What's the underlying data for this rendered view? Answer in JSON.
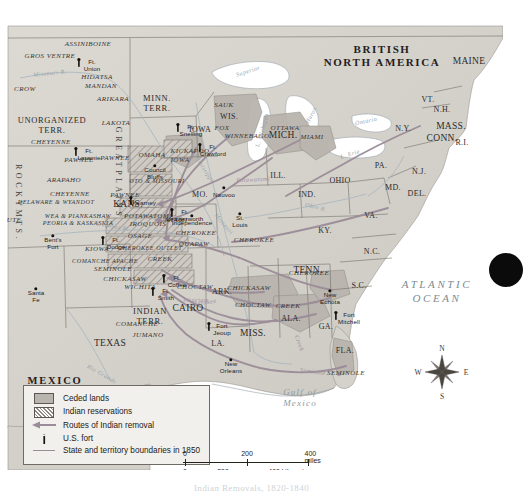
{
  "map": {
    "title": "Indian Removals, 1820-1840",
    "countries": [
      {
        "name": "BRITISH NORTH AMERICA",
        "x": 382,
        "y": 48
      },
      {
        "name": "MEXICO",
        "x": 55,
        "y": 372
      }
    ],
    "oceans": [
      {
        "name": "ATLANTIC OCEAN",
        "x": 437,
        "y": 283
      },
      {
        "name": "Gulf of Mexico",
        "x": 300,
        "y": 390
      }
    ],
    "regions": [
      {
        "name": "GREAT PLAINS",
        "x": 118,
        "y": 165
      },
      {
        "name": "ROCKY MTS.",
        "x": 18,
        "y": 195
      }
    ],
    "territories": [
      {
        "name": "UNORGANIZED TERR.",
        "x": 52,
        "y": 117
      },
      {
        "name": "MINN. TERR.",
        "x": 157,
        "y": 95
      },
      {
        "name": "INDIAN TERR.",
        "x": 150,
        "y": 308
      }
    ],
    "states": [
      {
        "name": "MAINE",
        "x": 469,
        "y": 53
      },
      {
        "name": "VT.",
        "x": 428,
        "y": 91
      },
      {
        "name": "N.H.",
        "x": 442,
        "y": 101
      },
      {
        "name": "MASS.",
        "x": 451,
        "y": 118
      },
      {
        "name": "CONN.",
        "x": 442,
        "y": 130
      },
      {
        "name": "R.I.",
        "x": 462,
        "y": 134
      },
      {
        "name": "N.Y.",
        "x": 403,
        "y": 120
      },
      {
        "name": "PA.",
        "x": 381,
        "y": 157
      },
      {
        "name": "N.J.",
        "x": 419,
        "y": 163
      },
      {
        "name": "MD.",
        "x": 393,
        "y": 179
      },
      {
        "name": "DEL.",
        "x": 417,
        "y": 185
      },
      {
        "name": "VA.",
        "x": 371,
        "y": 207
      },
      {
        "name": "OHIO",
        "x": 340,
        "y": 172
      },
      {
        "name": "IND.",
        "x": 307,
        "y": 186
      },
      {
        "name": "ILL.",
        "x": 278,
        "y": 167
      },
      {
        "name": "MICH.",
        "x": 283,
        "y": 127
      },
      {
        "name": "WIS.",
        "x": 229,
        "y": 108
      },
      {
        "name": "IOWA",
        "x": 200,
        "y": 121
      },
      {
        "name": "MO.",
        "x": 200,
        "y": 186
      },
      {
        "name": "ARK.",
        "x": 222,
        "y": 283
      },
      {
        "name": "LA.",
        "x": 218,
        "y": 335
      },
      {
        "name": "MISS.",
        "x": 253,
        "y": 325
      },
      {
        "name": "ALA.",
        "x": 291,
        "y": 310
      },
      {
        "name": "GA.",
        "x": 326,
        "y": 318
      },
      {
        "name": "FLA.",
        "x": 345,
        "y": 342
      },
      {
        "name": "TENN.",
        "x": 308,
        "y": 262
      },
      {
        "name": "KY.",
        "x": 325,
        "y": 222
      },
      {
        "name": "N.C.",
        "x": 372,
        "y": 243
      },
      {
        "name": "S.C.",
        "x": 359,
        "y": 277
      },
      {
        "name": "TEXAS",
        "x": 110,
        "y": 335
      },
      {
        "name": "KANS.",
        "x": 128,
        "y": 196
      },
      {
        "name": "CAIRO",
        "x": 188,
        "y": 300
      }
    ],
    "tribes": [
      {
        "name": "ASSINIBOINE",
        "x": 88,
        "y": 36
      },
      {
        "name": "GROS VENTRE",
        "x": 50,
        "y": 48
      },
      {
        "name": "HIDATSA",
        "x": 97,
        "y": 69
      },
      {
        "name": "MANDAN",
        "x": 101,
        "y": 78
      },
      {
        "name": "ARIKARA",
        "x": 113,
        "y": 91
      },
      {
        "name": "CROW",
        "x": 25,
        "y": 81
      },
      {
        "name": "LAKOTA",
        "x": 116,
        "y": 115
      },
      {
        "name": "CHEYENNE",
        "x": 51,
        "y": 134
      },
      {
        "name": "PAWNEE",
        "x": 79,
        "y": 152
      },
      {
        "name": "ARAPAHO",
        "x": 64,
        "y": 172
      },
      {
        "name": "CHEYENNE",
        "x": 70,
        "y": 186
      },
      {
        "name": "DELAWARE & WYANDOT",
        "x": 56,
        "y": 193
      },
      {
        "name": "WEA & PIANKASHAW",
        "x": 78,
        "y": 207
      },
      {
        "name": "PEORIA & KASKASKIA",
        "x": 78,
        "y": 214
      },
      {
        "name": "UTE",
        "x": 14,
        "y": 212
      },
      {
        "name": "KIOWA",
        "x": 97,
        "y": 241
      },
      {
        "name": "COMANCHE APACHE",
        "x": 105,
        "y": 252
      },
      {
        "name": "SEMINOLE",
        "x": 113,
        "y": 261
      },
      {
        "name": "CHICKASAW",
        "x": 125,
        "y": 271
      },
      {
        "name": "WICHITA",
        "x": 140,
        "y": 279
      },
      {
        "name": "COMANCHE",
        "x": 137,
        "y": 316
      },
      {
        "name": "JUMANO",
        "x": 148,
        "y": 327
      },
      {
        "name": "PAWNEE",
        "x": 115,
        "y": 150
      },
      {
        "name": "PAWNEE",
        "x": 125,
        "y": 187
      },
      {
        "name": "OMAHA",
        "x": 152,
        "y": 147
      },
      {
        "name": "OTO & MISSOURI",
        "x": 157,
        "y": 172
      },
      {
        "name": "IOWA",
        "x": 180,
        "y": 152
      },
      {
        "name": "POTAWATOMI",
        "x": 148,
        "y": 208
      },
      {
        "name": "IROQUOIS",
        "x": 148,
        "y": 216
      },
      {
        "name": "OSAGE",
        "x": 140,
        "y": 228
      },
      {
        "name": "CHEROKEE OUTLET",
        "x": 150,
        "y": 239
      },
      {
        "name": "CREEK",
        "x": 160,
        "y": 251
      },
      {
        "name": "KICKAPOO",
        "x": 190,
        "y": 143
      },
      {
        "name": "MIAMI",
        "x": 176,
        "y": 212
      },
      {
        "name": "CHEROKEE",
        "x": 196,
        "y": 225
      },
      {
        "name": "QUAPAW",
        "x": 194,
        "y": 236
      },
      {
        "name": "CHEROKEE",
        "x": 254,
        "y": 232
      },
      {
        "name": "CHOCTAW",
        "x": 195,
        "y": 279
      },
      {
        "name": "CHICKASAW",
        "x": 249,
        "y": 280
      },
      {
        "name": "CHOCTAW",
        "x": 253,
        "y": 297
      },
      {
        "name": "CREEK",
        "x": 288,
        "y": 298
      },
      {
        "name": "CHEROKEE",
        "x": 309,
        "y": 265
      },
      {
        "name": "SEMINOLE",
        "x": 346,
        "y": 365
      },
      {
        "name": "SAUK",
        "x": 224,
        "y": 97
      },
      {
        "name": "FOX",
        "x": 222,
        "y": 120
      },
      {
        "name": "WINNEBAGO",
        "x": 247,
        "y": 128
      },
      {
        "name": "OTTAWA",
        "x": 285,
        "y": 120
      },
      {
        "name": "MIAMI",
        "x": 312,
        "y": 129
      }
    ],
    "towns": [
      {
        "name": "Ft. Union",
        "x": 79,
        "y": 54,
        "fort": true
      },
      {
        "name": "Ft. Snelling",
        "x": 178,
        "y": 119,
        "fort": true
      },
      {
        "name": "Ft. Crawford",
        "x": 200,
        "y": 139,
        "fort": true
      },
      {
        "name": "Ft. Laramie",
        "x": 76,
        "y": 143,
        "fort": true
      },
      {
        "name": "Council Bluffs",
        "x": 155,
        "y": 158,
        "fort": false
      },
      {
        "name": "Kearney",
        "x": 131,
        "y": 192,
        "fort": true
      },
      {
        "name": "Ft. Leavenworth",
        "x": 172,
        "y": 204,
        "fort": true
      },
      {
        "name": "Bent's Fort",
        "x": 53,
        "y": 228,
        "fort": false
      },
      {
        "name": "Ft. Dodge",
        "x": 103,
        "y": 232,
        "fort": true
      },
      {
        "name": "Santa Fe",
        "x": 36,
        "y": 281,
        "fort": false
      },
      {
        "name": "Ft. Coffee",
        "x": 164,
        "y": 270,
        "fort": true
      },
      {
        "name": "Ft. Smith",
        "x": 153,
        "y": 283,
        "fort": true
      },
      {
        "name": "Independence",
        "x": 192,
        "y": 208,
        "fort": false
      },
      {
        "name": "St. Louis",
        "x": 240,
        "y": 206,
        "fort": false
      },
      {
        "name": "Nauvoo",
        "x": 224,
        "y": 180,
        "fort": false
      },
      {
        "name": "Fort Jeoup",
        "x": 209,
        "y": 318,
        "fort": true
      },
      {
        "name": "New Orleans",
        "x": 231,
        "y": 352,
        "fort": false
      },
      {
        "name": "New Echota",
        "x": 330,
        "y": 283,
        "fort": false
      },
      {
        "name": "Fort Mitchell",
        "x": 336,
        "y": 307,
        "fort": true
      }
    ],
    "waters": [
      {
        "name": "Missouri R.",
        "x": 50,
        "y": 65,
        "rot": -6
      },
      {
        "name": "Superior",
        "x": 248,
        "y": 63,
        "rot": -18
      },
      {
        "name": "L. Michigan",
        "x": 262,
        "y": 122,
        "rot": -74
      },
      {
        "name": "Huron",
        "x": 311,
        "y": 107,
        "rot": -62
      },
      {
        "name": "Ontario",
        "x": 366,
        "y": 113,
        "rot": -12
      },
      {
        "name": "L. Erie",
        "x": 350,
        "y": 146,
        "rot": -18
      },
      {
        "name": "Mississippi",
        "x": 204,
        "y": 160,
        "rot": 58
      },
      {
        "name": "Missouri",
        "x": 224,
        "y": 216,
        "rot": 50
      },
      {
        "name": "Ohio R.",
        "x": 316,
        "y": 199,
        "rot": 14
      },
      {
        "name": "Arkansas R.",
        "x": 112,
        "y": 218,
        "rot": 10
      },
      {
        "name": "Rio Grande",
        "x": 102,
        "y": 366,
        "rot": 30
      }
    ],
    "routes": [
      {
        "name": "Potawatomi",
        "x": 253,
        "y": 171,
        "rot": -3
      },
      {
        "name": "Cherokee",
        "x": 203,
        "y": 294,
        "rot": -8
      },
      {
        "name": "Choctaw",
        "x": 196,
        "y": 291,
        "rot": 0
      },
      {
        "name": "Creek",
        "x": 300,
        "y": 335,
        "rot": 70
      },
      {
        "name": "Seminole",
        "x": 313,
        "y": 363,
        "rot": 8
      }
    ],
    "compass": {
      "n": "N",
      "s": "S",
      "e": "E",
      "w": "W"
    }
  },
  "legend": {
    "items": [
      {
        "key": "ceded-swatch",
        "label": "Ceded lands"
      },
      {
        "key": "reservation-swatch",
        "label": "Indian reservations"
      },
      {
        "key": "route-arrow",
        "label": "Routes of Indian removal"
      },
      {
        "key": "fort-marker",
        "label": "U.S. fort"
      },
      {
        "key": "boundary-line",
        "label": "State and territory boundaries in 1850"
      }
    ]
  },
  "scale": {
    "miles": {
      "ticks": [
        "0",
        "200",
        "400 miles"
      ]
    },
    "kilometers": {
      "ticks": [
        "0",
        "200",
        "400 kilometers"
      ]
    }
  },
  "caption": "Indian Removals, 1820-1840",
  "colors": {
    "land": "#d7d4ce",
    "ceded": "#b9b4ad",
    "reservation": "#a39e97",
    "route": "#9a8c98",
    "water": "#ffffff",
    "border": "#6e6a64"
  }
}
